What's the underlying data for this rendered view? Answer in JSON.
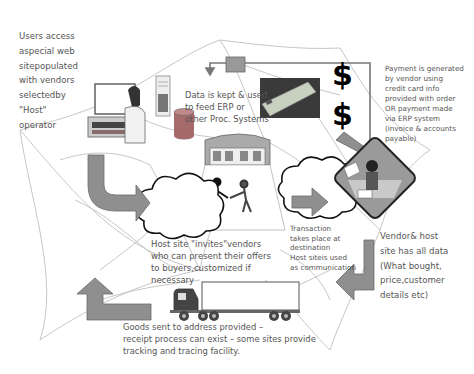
{
  "diagram": {
    "title": "",
    "labels": {
      "users_access": "Users access\naspecial web\nsitepopulated\nwith vendors\nselectedby\n\"Host\"\noperator",
      "data_kept": "Data is kept & used\nto feed ERP or\nother Proc. Systems",
      "payment": "Payment is generated\nby vendor using\ncredit card info\nprovided with order\nOR payment made\nvia ERP system\n(invoice & accounts\npayable)",
      "host_invites": "Host site \"invites\"vendors\nwho can present their offers\nto buyers,customized if\nnecessary",
      "transaction": "Transaction\ntakes place at\ndestination\nHost siteis used\nas communication",
      "vendor_host": "Vendor& host\nsite has all data\n(What bought,\nprice,customer\ndetails etc)",
      "goods_sent": "Goods sent to address provided –\nreceipt process can exist – some sites provide\ntracking and tracing facility."
    },
    "symbols": {
      "dollar_1": "$",
      "dollar_2": "$"
    },
    "icons": [
      "computer-user-icon",
      "server-icon",
      "database-cylinder-icon",
      "storefront-icon",
      "handshake-people-icon",
      "credit-card-icon",
      "vendor-operator-icon",
      "truck-icon",
      "cloud-icon",
      "arrow-icon"
    ],
    "colors": {
      "arrow_fill": "#8f8f8f",
      "arrow_stroke": "#6a6a6a",
      "web_lines": "#b5b5b5",
      "text": "#555555",
      "cloud_stroke": "#111111",
      "database": "#a56a6a"
    }
  }
}
